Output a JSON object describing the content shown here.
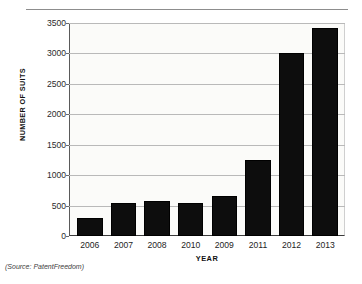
{
  "chart_data": {
    "type": "bar",
    "title": "",
    "subtitle": "",
    "xlabel": "YEAR",
    "ylabel": "NUMBER OF SUITS",
    "categories": [
      "2006",
      "2007",
      "2008",
      "2010",
      "2009",
      "2011",
      "2012",
      "2013"
    ],
    "values": [
      300,
      550,
      570,
      545,
      650,
      1250,
      3010,
      3420
    ],
    "series": [
      {
        "name": "Number of suits",
        "values": [
          300,
          550,
          570,
          545,
          650,
          1250,
          3010,
          3420
        ]
      }
    ],
    "ylim": [
      0,
      3500
    ],
    "yticks": [
      0,
      500,
      1000,
      1500,
      2000,
      2500,
      3000,
      3500
    ],
    "ytick_labels": [
      "0",
      "500",
      "1000",
      "1500",
      "2000",
      "2500",
      "3000",
      "3500"
    ],
    "grid": true,
    "grid_axis": "y",
    "legend": false,
    "legend_position": "none",
    "bar_color": "#0d0d0d",
    "plot_background": "#fbfbf9",
    "gridline_color": "#b9b9b9",
    "axis_color": "#3a3a3a"
  },
  "caption": {
    "source": "(Source: PatentFreedom)"
  }
}
